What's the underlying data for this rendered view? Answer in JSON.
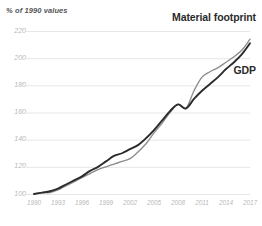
{
  "chart_data": {
    "type": "line",
    "title": "",
    "ylabel": "% of 1990 values",
    "xlabel": "",
    "ylim": [
      100,
      220
    ],
    "xlim": [
      1990,
      2017
    ],
    "grid": true,
    "legend_position": "inline-right",
    "yticks": [
      100,
      120,
      140,
      160,
      180,
      200,
      220
    ],
    "xticks": [
      1990,
      1993,
      1996,
      1999,
      2002,
      2005,
      2008,
      2011,
      2014,
      2017
    ],
    "x": [
      1990,
      1991,
      1992,
      1993,
      1994,
      1995,
      1996,
      1997,
      1998,
      1999,
      2000,
      2001,
      2002,
      2003,
      2004,
      2005,
      2006,
      2007,
      2008,
      2009,
      2010,
      2011,
      2012,
      2013,
      2014,
      2015,
      2016,
      2017
    ],
    "series": [
      {
        "name": "Material footprint",
        "color": "#8c8c8c",
        "values": [
          100,
          101,
          101,
          103,
          106,
          109,
          112,
          115,
          118,
          120,
          122,
          124,
          126,
          131,
          137,
          145,
          152,
          160,
          166,
          163,
          176,
          186,
          190,
          193,
          197,
          201,
          206,
          214
        ]
      },
      {
        "name": "GDP",
        "color": "#2b2b2b",
        "values": [
          100,
          101,
          102,
          104,
          107,
          110,
          113,
          117,
          120,
          124,
          128,
          130,
          133,
          136,
          141,
          147,
          154,
          161,
          166,
          163,
          170,
          176,
          181,
          186,
          192,
          197,
          203,
          211
        ]
      }
    ],
    "annotations": [
      {
        "text": "Material\nfootprint",
        "series": "Material footprint"
      },
      {
        "text": "GDP",
        "series": "GDP"
      }
    ]
  },
  "colors": {
    "gridline": "#e6e6e6",
    "tick_text": "#b9b9b9",
    "title_text": "#555555",
    "material_footprint": "#8c8c8c",
    "gdp": "#2b2b2b"
  }
}
